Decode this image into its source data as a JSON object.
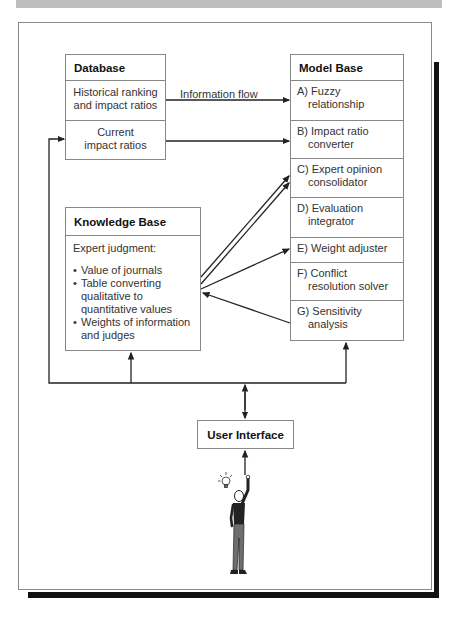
{
  "diagram": {
    "type": "system-architecture",
    "database": {
      "title": "Database",
      "rows": [
        "Historical ranking and impact ratios",
        "Current impact ratios"
      ],
      "row_lines": [
        [
          "Historical ranking",
          "and impact ratios"
        ],
        [
          "Current",
          "impact ratios"
        ]
      ]
    },
    "flow_label": "Information flow",
    "model_base": {
      "title": "Model Base",
      "items": [
        {
          "key": "A)",
          "line1": "Fuzzy",
          "line2": "relationship"
        },
        {
          "key": "B)",
          "line1": "Impact ratio",
          "line2": "converter"
        },
        {
          "key": "C)",
          "line1": "Expert opinion",
          "line2": "consolidator"
        },
        {
          "key": "D)",
          "line1": "Evaluation",
          "line2": "integrator"
        },
        {
          "key": "E)",
          "line1": "Weight adjuster",
          "line2": ""
        },
        {
          "key": "F)",
          "line1": "Conflict",
          "line2": "resolution solver"
        },
        {
          "key": "G)",
          "line1": "Sensitivity",
          "line2": "analysis"
        }
      ]
    },
    "knowledge_base": {
      "title": "Knowledge Base",
      "intro": "Expert judgment:",
      "bullets": [
        [
          "Value of journals"
        ],
        [
          "Table converting",
          "qualitative to",
          "quantitative values"
        ],
        [
          "Weights of information",
          "and judges"
        ]
      ]
    },
    "user_interface": {
      "title": "User Interface"
    },
    "icons": {
      "person": "person-with-lightbulb-icon"
    },
    "colors": {
      "line": "#222222",
      "box_border": "#888888",
      "shadow": "#111111",
      "top_band": "#bdbdbd"
    }
  }
}
